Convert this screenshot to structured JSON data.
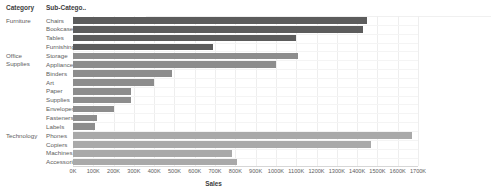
{
  "header": {
    "category_label": "Category",
    "subcategory_label": "Sub-Catego.."
  },
  "axis": {
    "title": "Sales",
    "ticks": [
      "0K",
      "100K",
      "200K",
      "300K",
      "400K",
      "500K",
      "600K",
      "700K",
      "800K",
      "900K",
      "1000K",
      "1100K",
      "1200K",
      "1300K",
      "1400K",
      "1500K",
      "1600K",
      "1700K"
    ]
  },
  "colors": {
    "furniture": "#5c5c5c",
    "office_supplies": "#8d8d8d",
    "technology": "#a9a9a9",
    "grid": "#eeeeee",
    "text": "#5e5e5e"
  },
  "categories": [
    {
      "name": "Furniture",
      "row_start": 0,
      "row_count": 4
    },
    {
      "name": "Office Supplies",
      "row_start": 4,
      "row_count": 9
    },
    {
      "name": "Technology",
      "row_start": 13,
      "row_count": 4
    }
  ],
  "chart_data": {
    "type": "bar",
    "orientation": "horizontal",
    "title": "",
    "xlabel": "Sales",
    "ylabel": "",
    "xlim": [
      0,
      1700
    ],
    "grid": true,
    "legend": "none",
    "categories": [
      "Chairs",
      "Bookcases",
      "Tables",
      "Furnishings",
      "Storage",
      "Appliances",
      "Binders",
      "Art",
      "Paper",
      "Supplies",
      "Envelopes",
      "Fasteners",
      "Labels",
      "Phones",
      "Copiers",
      "Machines",
      "Accessories"
    ],
    "groups": [
      "Furniture",
      "Furniture",
      "Furniture",
      "Furniture",
      "Office Supplies",
      "Office Supplies",
      "Office Supplies",
      "Office Supplies",
      "Office Supplies",
      "Office Supplies",
      "Office Supplies",
      "Office Supplies",
      "Office Supplies",
      "Technology",
      "Technology",
      "Technology",
      "Technology"
    ],
    "values": [
      1450,
      1430,
      1100,
      690,
      1110,
      1000,
      490,
      400,
      285,
      285,
      200,
      120,
      110,
      1670,
      1470,
      785,
      810
    ],
    "units": "K"
  }
}
